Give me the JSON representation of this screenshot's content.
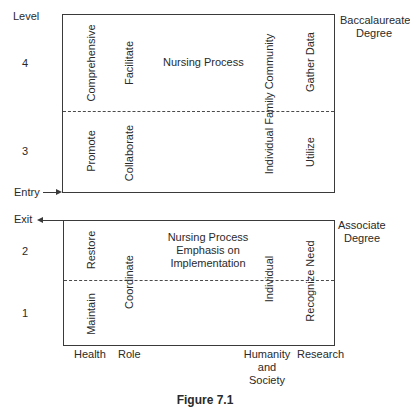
{
  "axis": {
    "level_label": "Level",
    "levels": [
      "4",
      "3",
      "2",
      "1"
    ],
    "entry_label": "Entry",
    "exit_label": "Exit"
  },
  "upper_box": {
    "degree_line1": "Baccalaureate",
    "degree_line2": "Degree",
    "title": "Nursing Process",
    "columns": {
      "health": {
        "level4": "Comprehensive",
        "level3": "Promote"
      },
      "role": {
        "level4": "Facilitate",
        "level3": "Collaborate"
      },
      "humanity": {
        "span": "Individual Family Community"
      },
      "research": {
        "level4": "Gather Data",
        "level3": "Utilize"
      }
    }
  },
  "lower_box": {
    "degree_line1": "Associate",
    "degree_line2": "Degree",
    "title_line1": "Nursing Process",
    "title_line2": "Emphasis on",
    "title_line3": "Implementation",
    "columns": {
      "health": {
        "level2": "Restore",
        "level1": "Maintain"
      },
      "role": {
        "span": "Coordinate"
      },
      "humanity": {
        "span": "Individual"
      },
      "research": {
        "span": "Recognize Need"
      }
    }
  },
  "x_categories": {
    "health": "Health",
    "role": "Role",
    "humanity_line1": "Humanity",
    "humanity_line2": "and",
    "humanity_line3": "Society",
    "research": "Research"
  },
  "caption": "Figure 7.1"
}
